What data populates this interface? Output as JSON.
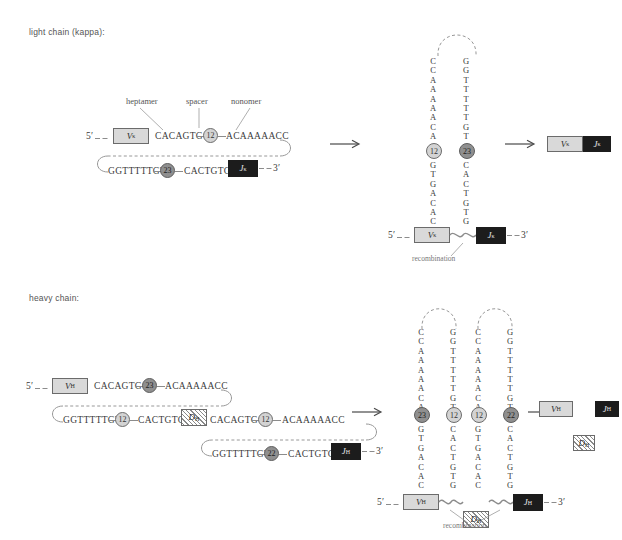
{
  "sections": {
    "light": {
      "title": "light chain (kappa):"
    },
    "heavy": {
      "title": "heavy chain:"
    }
  },
  "callouts": {
    "heptamer": "heptamer",
    "spacer": "spacer",
    "nonomer": "nonomer"
  },
  "ends": {
    "five_prime": "5′",
    "three_prime": "3′"
  },
  "captions": {
    "recombination": "recombination"
  },
  "segments": {
    "v_kappa": "V",
    "v_kappa_sub": "κ",
    "j_kappa": "J",
    "j_kappa_sub": "κ",
    "v_heavy": "V",
    "v_heavy_sub": "H",
    "d_heavy": "D",
    "d_heavy_sub": "H",
    "j_heavy": "J",
    "j_heavy_sub": "H"
  },
  "light_chain": {
    "top_strand": {
      "heptamer": "CACAGTG",
      "spacer": "12",
      "nonomer": "ACAAAAACC"
    },
    "bottom_strand": {
      "nonomer": "GGTTTTTGT",
      "spacer": "23",
      "heptamer": "CACTGTG"
    },
    "hairpin": {
      "left_upper": [
        "C",
        "C",
        "A",
        "A",
        "A",
        "A",
        "A",
        "C",
        "A"
      ],
      "right_upper": [
        "G",
        "G",
        "T",
        "T",
        "T",
        "T",
        "T",
        "G",
        "T"
      ],
      "left_spacer": "12",
      "right_spacer": "23",
      "left_lower": [
        "G",
        "T",
        "G",
        "A",
        "C",
        "A",
        "C"
      ],
      "right_lower": [
        "C",
        "A",
        "C",
        "T",
        "G",
        "T",
        "G"
      ]
    }
  },
  "heavy_chain": {
    "row1": {
      "heptamer": "CACAGTG",
      "spacer": "23",
      "nonomer": "ACAAAAACC"
    },
    "row2": {
      "nonomer": "GGTTTTTGT",
      "spacer_left": "12",
      "heptamer_left": "CACTGTG",
      "heptamer_right": "CACAGTG",
      "spacer_right": "12",
      "nonomer_right": "ACAAAAACC"
    },
    "row3": {
      "nonomer": "GGTTTTTGT",
      "spacer": "22",
      "heptamer": "CACTGTG"
    },
    "hairpin": {
      "col1": {
        "upper": [
          "C",
          "C",
          "A",
          "A",
          "A",
          "A",
          "A",
          "C",
          "A"
        ],
        "spacer": "23",
        "lower": [
          "G",
          "T",
          "G",
          "A",
          "C",
          "A",
          "C"
        ]
      },
      "col2": {
        "upper": [
          "G",
          "G",
          "T",
          "T",
          "T",
          "T",
          "T",
          "G",
          "T"
        ],
        "spacer": "12",
        "lower": [
          "C",
          "A",
          "C",
          "T",
          "G",
          "T",
          "G"
        ]
      },
      "col3": {
        "upper": [
          "C",
          "C",
          "A",
          "A",
          "A",
          "A",
          "A",
          "C",
          "A"
        ],
        "spacer": "12",
        "lower": [
          "G",
          "T",
          "G",
          "A",
          "C",
          "A",
          "C"
        ]
      },
      "col4": {
        "upper": [
          "G",
          "G",
          "T",
          "T",
          "T",
          "T",
          "T",
          "G",
          "T"
        ],
        "spacer": "22",
        "lower": [
          "C",
          "A",
          "C",
          "T",
          "G",
          "T",
          "G"
        ]
      }
    }
  }
}
